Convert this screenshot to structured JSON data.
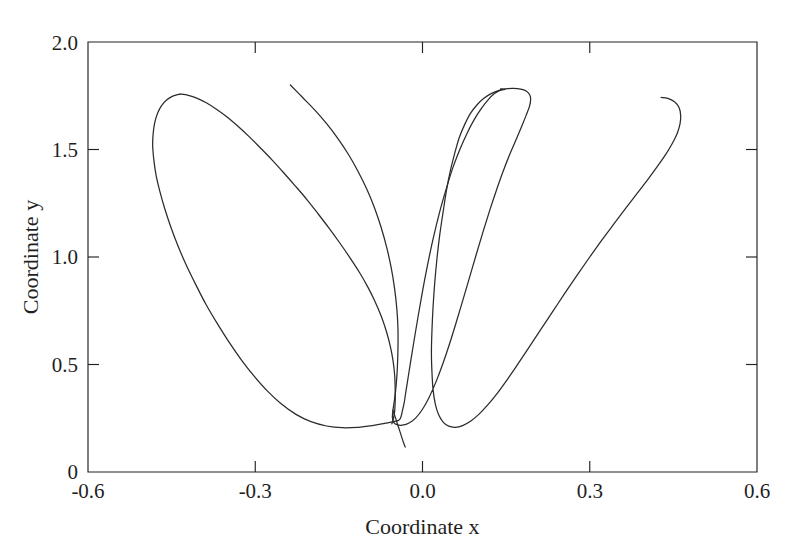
{
  "chart_data": {
    "type": "line",
    "title": "",
    "subtitle": "",
    "xlabel": "Coordinate x",
    "ylabel": "Coordinate y",
    "xlim": [
      -0.6,
      0.6
    ],
    "ylim": [
      0,
      2.0
    ],
    "xticks": [
      -0.6,
      -0.3,
      0.0,
      0.3,
      0.6
    ],
    "xtick_labels": [
      "-0.6",
      "-0.3",
      "0.0",
      "0.3",
      "0.6"
    ],
    "yticks": [
      0,
      0.5,
      1.0,
      1.5,
      2.0
    ],
    "ytick_labels": [
      "0",
      "0.5",
      "1.0",
      "1.5",
      "2.0"
    ],
    "grid": false,
    "legend": null,
    "legend_position": "none",
    "tick_direction": "in",
    "frame": "box",
    "annotations": [],
    "series": [
      {
        "name": "trajectory",
        "color": "#2b2b2b",
        "line_width": 1.25,
        "closed": false,
        "description": "Single continuous open trajectory forming two elongated petal loops meeting near the origin region, with two free ends rising to the upper left and upper right.",
        "points": [
          [
            -0.237,
            1.8
          ],
          [
            -0.215,
            1.742
          ],
          [
            -0.193,
            1.683
          ],
          [
            -0.172,
            1.62
          ],
          [
            -0.152,
            1.552
          ],
          [
            -0.133,
            1.478
          ],
          [
            -0.116,
            1.4
          ],
          [
            -0.1,
            1.316
          ],
          [
            -0.086,
            1.228
          ],
          [
            -0.074,
            1.136
          ],
          [
            -0.064,
            1.042
          ],
          [
            -0.056,
            0.948
          ],
          [
            -0.05,
            0.852
          ],
          [
            -0.046,
            0.758
          ],
          [
            -0.044,
            0.666
          ],
          [
            -0.044,
            0.576
          ],
          [
            -0.045,
            0.49
          ],
          [
            -0.047,
            0.41
          ],
          [
            -0.05,
            0.34
          ],
          [
            -0.053,
            0.288
          ],
          [
            -0.054,
            0.255
          ],
          [
            -0.052,
            0.232
          ],
          [
            -0.046,
            0.22
          ],
          [
            -0.036,
            0.218
          ],
          [
            -0.024,
            0.228
          ],
          [
            -0.012,
            0.252
          ],
          [
            0.0,
            0.292
          ],
          [
            0.012,
            0.348
          ],
          [
            0.024,
            0.418
          ],
          [
            0.036,
            0.5
          ],
          [
            0.048,
            0.592
          ],
          [
            0.06,
            0.692
          ],
          [
            0.072,
            0.796
          ],
          [
            0.084,
            0.902
          ],
          [
            0.096,
            1.008
          ],
          [
            0.108,
            1.112
          ],
          [
            0.12,
            1.212
          ],
          [
            0.132,
            1.306
          ],
          [
            0.144,
            1.394
          ],
          [
            0.156,
            1.474
          ],
          [
            0.168,
            1.546
          ],
          [
            0.178,
            1.608
          ],
          [
            0.186,
            1.66
          ],
          [
            0.192,
            1.702
          ],
          [
            0.194,
            1.734
          ],
          [
            0.192,
            1.756
          ],
          [
            0.186,
            1.772
          ],
          [
            0.176,
            1.781
          ],
          [
            0.163,
            1.784
          ],
          [
            0.149,
            1.782
          ],
          [
            0.136,
            1.774
          ],
          [
            0.123,
            1.76
          ],
          [
            0.11,
            1.738
          ],
          [
            0.098,
            1.708
          ],
          [
            0.086,
            1.668
          ],
          [
            0.076,
            1.618
          ],
          [
            0.066,
            1.556
          ],
          [
            0.058,
            1.484
          ],
          [
            0.05,
            1.402
          ],
          [
            0.043,
            1.31
          ],
          [
            0.037,
            1.21
          ],
          [
            0.031,
            1.104
          ],
          [
            0.026,
            0.994
          ],
          [
            0.022,
            0.882
          ],
          [
            0.019,
            0.77
          ],
          [
            0.017,
            0.66
          ],
          [
            0.016,
            0.556
          ],
          [
            0.017,
            0.462
          ],
          [
            0.019,
            0.382
          ],
          [
            0.023,
            0.316
          ],
          [
            0.029,
            0.266
          ],
          [
            0.037,
            0.232
          ],
          [
            0.047,
            0.213
          ],
          [
            0.059,
            0.208
          ],
          [
            0.072,
            0.216
          ],
          [
            0.086,
            0.236
          ],
          [
            0.101,
            0.268
          ],
          [
            0.117,
            0.312
          ],
          [
            0.134,
            0.366
          ],
          [
            0.152,
            0.43
          ],
          [
            0.171,
            0.502
          ],
          [
            0.191,
            0.58
          ],
          [
            0.212,
            0.662
          ],
          [
            0.234,
            0.748
          ],
          [
            0.256,
            0.834
          ],
          [
            0.278,
            0.918
          ],
          [
            0.3,
            1.0
          ],
          [
            0.322,
            1.08
          ],
          [
            0.344,
            1.156
          ],
          [
            0.365,
            1.228
          ],
          [
            0.385,
            1.296
          ],
          [
            0.404,
            1.36
          ],
          [
            0.421,
            1.42
          ],
          [
            0.436,
            1.476
          ],
          [
            0.448,
            1.528
          ],
          [
            0.457,
            1.576
          ],
          [
            0.462,
            1.62
          ],
          [
            0.463,
            1.66
          ],
          [
            0.46,
            1.696
          ],
          [
            0.452,
            1.722
          ],
          [
            0.44,
            1.738
          ],
          [
            0.428,
            1.742
          ]
        ],
        "points_second_lobe": [
          [
            -0.435,
            1.758
          ],
          [
            -0.448,
            1.748
          ],
          [
            -0.459,
            1.73
          ],
          [
            -0.468,
            1.704
          ],
          [
            -0.475,
            1.67
          ],
          [
            -0.48,
            1.628
          ],
          [
            -0.483,
            1.578
          ],
          [
            -0.484,
            1.52
          ],
          [
            -0.482,
            1.454
          ],
          [
            -0.478,
            1.382
          ],
          [
            -0.471,
            1.304
          ],
          [
            -0.462,
            1.222
          ],
          [
            -0.451,
            1.136
          ],
          [
            -0.438,
            1.048
          ],
          [
            -0.423,
            0.958
          ],
          [
            -0.406,
            0.868
          ],
          [
            -0.388,
            0.778
          ],
          [
            -0.368,
            0.69
          ],
          [
            -0.347,
            0.604
          ],
          [
            -0.325,
            0.522
          ],
          [
            -0.302,
            0.446
          ],
          [
            -0.278,
            0.376
          ],
          [
            -0.253,
            0.316
          ],
          [
            -0.227,
            0.268
          ],
          [
            -0.2,
            0.234
          ],
          [
            -0.172,
            0.214
          ],
          [
            -0.144,
            0.206
          ],
          [
            -0.116,
            0.208
          ],
          [
            -0.09,
            0.216
          ],
          [
            -0.068,
            0.226
          ],
          [
            -0.052,
            0.234
          ],
          [
            -0.043,
            0.24
          ],
          [
            -0.04,
            0.248
          ],
          [
            -0.038,
            0.262
          ],
          [
            -0.036,
            0.285
          ],
          [
            -0.033,
            0.32
          ],
          [
            -0.03,
            0.37
          ],
          [
            -0.026,
            0.436
          ],
          [
            -0.021,
            0.518
          ],
          [
            -0.015,
            0.614
          ],
          [
            -0.008,
            0.722
          ],
          [
            0.0,
            0.84
          ],
          [
            0.009,
            0.962
          ],
          [
            0.019,
            1.084
          ],
          [
            0.03,
            1.202
          ],
          [
            0.042,
            1.312
          ],
          [
            0.054,
            1.412
          ],
          [
            0.067,
            1.5
          ],
          [
            0.08,
            1.576
          ],
          [
            0.093,
            1.64
          ],
          [
            0.106,
            1.692
          ],
          [
            0.118,
            1.732
          ],
          [
            0.129,
            1.76
          ],
          [
            0.139,
            1.775
          ],
          [
            0.148,
            1.78
          ],
          [
            0.14,
            1.782
          ]
        ],
        "points_left_petal_inner": [
          [
            -0.435,
            1.758
          ],
          [
            -0.42,
            1.752
          ],
          [
            -0.404,
            1.738
          ],
          [
            -0.387,
            1.716
          ],
          [
            -0.369,
            1.686
          ],
          [
            -0.35,
            1.65
          ],
          [
            -0.331,
            1.608
          ],
          [
            -0.311,
            1.56
          ],
          [
            -0.291,
            1.508
          ],
          [
            -0.27,
            1.452
          ],
          [
            -0.249,
            1.392
          ],
          [
            -0.228,
            1.33
          ],
          [
            -0.207,
            1.266
          ],
          [
            -0.187,
            1.2
          ],
          [
            -0.167,
            1.132
          ],
          [
            -0.148,
            1.064
          ],
          [
            -0.13,
            0.996
          ],
          [
            -0.113,
            0.928
          ],
          [
            -0.098,
            0.86
          ],
          [
            -0.085,
            0.792
          ],
          [
            -0.074,
            0.724
          ],
          [
            -0.065,
            0.656
          ],
          [
            -0.058,
            0.588
          ],
          [
            -0.053,
            0.52
          ],
          [
            -0.05,
            0.452
          ],
          [
            -0.049,
            0.386
          ],
          [
            -0.049,
            0.328
          ],
          [
            -0.05,
            0.282
          ],
          [
            -0.052,
            0.25
          ],
          [
            -0.054,
            0.232
          ],
          [
            -0.055,
            0.224
          ]
        ],
        "points_tail_down": [
          [
            -0.053,
            0.288
          ],
          [
            -0.048,
            0.248
          ],
          [
            -0.043,
            0.208
          ],
          [
            -0.038,
            0.168
          ],
          [
            -0.034,
            0.136
          ],
          [
            -0.031,
            0.116
          ]
        ]
      }
    ]
  },
  "axes": {
    "x_title": "Coordinate x",
    "y_title": "Coordinate y"
  }
}
